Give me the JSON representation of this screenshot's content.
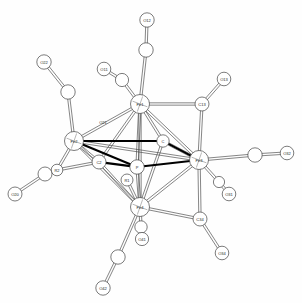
{
  "figure": {
    "type": "molecular-structure-diagram",
    "style": "ORTEP thermal-ellipsoid crystal structure",
    "background_color": "#fefefe",
    "line_color": "#3a3a3a",
    "bold_bond_color": "#000000",
    "atom_fill": "#ffffff",
    "atom_stroke": "#444444",
    "label_color": "#2b2b2b",
    "width": 302,
    "height": 303
  },
  "atoms": [
    {
      "id": "Fe1",
      "label": "Fe1",
      "x": 140,
      "y": 104,
      "r": 9.5,
      "kind": "metal",
      "labelled": true
    },
    {
      "id": "Fe2",
      "label": "Fe2",
      "x": 74,
      "y": 141,
      "r": 9.5,
      "kind": "metal",
      "labelled": true
    },
    {
      "id": "Fe3",
      "label": "Fe3",
      "x": 199,
      "y": 160,
      "r": 9.5,
      "kind": "metal",
      "labelled": true
    },
    {
      "id": "Fe4",
      "label": "Fe4",
      "x": 140,
      "y": 207,
      "r": 9.5,
      "kind": "metal",
      "labelled": true
    },
    {
      "id": "C2",
      "label": "C2",
      "x": 99,
      "y": 162,
      "r": 7.0,
      "kind": "carbide",
      "labelled": true
    },
    {
      "id": "Ccen",
      "label": "C",
      "x": 163,
      "y": 141,
      "r": 6.2,
      "kind": "carbide",
      "labelled": true
    },
    {
      "id": "P1core",
      "label": "P",
      "x": 137,
      "y": 167,
      "r": 7.2,
      "kind": "carbide",
      "labelled": true
    },
    {
      "id": "R1",
      "label": "R1",
      "x": 127,
      "y": 180,
      "r": 6.0,
      "kind": "carbide",
      "labelled": true
    },
    {
      "id": "R2",
      "label": "R2",
      "x": 57,
      "y": 170,
      "r": 5.8,
      "kind": "carbide",
      "labelled": true
    },
    {
      "id": "C13",
      "label": "C13",
      "x": 202,
      "y": 104,
      "r": 7.0,
      "kind": "carbonylC",
      "labelled": true
    },
    {
      "id": "C34",
      "label": "C34",
      "x": 200,
      "y": 219,
      "r": 7.0,
      "kind": "carbonylC",
      "labelled": true
    },
    {
      "id": "C12",
      "label": "",
      "x": 146,
      "y": 50,
      "r": 7.2,
      "kind": "carbonylC",
      "labelled": false
    },
    {
      "id": "C11",
      "label": "",
      "x": 122,
      "y": 80,
      "r": 6.6,
      "kind": "carbonylC",
      "labelled": false
    },
    {
      "id": "C22",
      "label": "",
      "x": 68,
      "y": 92,
      "r": 7.2,
      "kind": "carbonylC",
      "labelled": false
    },
    {
      "id": "C20",
      "label": "",
      "x": 45,
      "y": 174,
      "r": 7.0,
      "kind": "carbonylC",
      "labelled": false
    },
    {
      "id": "C32",
      "label": "",
      "x": 255,
      "y": 155,
      "r": 7.2,
      "kind": "carbonylC",
      "labelled": false
    },
    {
      "id": "C31",
      "label": "",
      "x": 219,
      "y": 182,
      "r": 5.6,
      "kind": "carbonylC",
      "labelled": false
    },
    {
      "id": "C41",
      "label": "",
      "x": 141,
      "y": 227,
      "r": 6.2,
      "kind": "carbonylC",
      "labelled": false
    },
    {
      "id": "C42",
      "label": "",
      "x": 118,
      "y": 257,
      "r": 7.2,
      "kind": "carbonylC",
      "labelled": false
    },
    {
      "id": "O12",
      "label": "O12",
      "x": 147,
      "y": 20,
      "r": 7.2,
      "kind": "oxygen",
      "labelled": true
    },
    {
      "id": "O11",
      "label": "O11",
      "x": 104,
      "y": 69,
      "r": 6.8,
      "kind": "oxygen",
      "labelled": true
    },
    {
      "id": "O22",
      "label": "O22",
      "x": 44,
      "y": 62,
      "r": 7.2,
      "kind": "oxygen",
      "labelled": true
    },
    {
      "id": "O20",
      "label": "O20",
      "x": 15,
      "y": 194,
      "r": 7.0,
      "kind": "oxygen",
      "labelled": true
    },
    {
      "id": "O21",
      "label": "O21",
      "x": 103,
      "y": 122,
      "r": 0,
      "kind": "label-only",
      "labelled": true
    },
    {
      "id": "O13",
      "label": "O13",
      "x": 224,
      "y": 79,
      "r": 6.8,
      "kind": "oxygen",
      "labelled": true
    },
    {
      "id": "O32",
      "label": "O32",
      "x": 287,
      "y": 153,
      "r": 6.8,
      "kind": "oxygen",
      "labelled": true
    },
    {
      "id": "O31",
      "label": "O31",
      "x": 229,
      "y": 194,
      "r": 6.8,
      "kind": "oxygen",
      "labelled": true
    },
    {
      "id": "O41",
      "label": "O41",
      "x": 142,
      "y": 239,
      "r": 6.6,
      "kind": "oxygen",
      "labelled": true
    },
    {
      "id": "O42",
      "label": "O42",
      "x": 103,
      "y": 288,
      "r": 7.2,
      "kind": "oxygen",
      "labelled": true
    },
    {
      "id": "O34",
      "label": "O34",
      "x": 222,
      "y": 253,
      "r": 6.8,
      "kind": "oxygen",
      "labelled": true
    }
  ],
  "bonds": [
    {
      "from": "Fe1",
      "to": "Fe2",
      "style": "thin-double"
    },
    {
      "from": "Fe1",
      "to": "Fe3",
      "style": "thin-double"
    },
    {
      "from": "Fe1",
      "to": "Fe4",
      "style": "thin-double"
    },
    {
      "from": "Fe2",
      "to": "Fe4",
      "style": "thin-double"
    },
    {
      "from": "Fe3",
      "to": "Fe4",
      "style": "thin-double"
    },
    {
      "from": "Fe2",
      "to": "Fe3",
      "style": "thin-double"
    },
    {
      "from": "Fe1",
      "to": "C2",
      "style": "thin-double"
    },
    {
      "from": "Fe1",
      "to": "Ccen",
      "style": "thin-double"
    },
    {
      "from": "Fe1",
      "to": "P1core",
      "style": "thin-double"
    },
    {
      "from": "Fe4",
      "to": "C2",
      "style": "thin-double"
    },
    {
      "from": "Fe4",
      "to": "Ccen",
      "style": "thin-double"
    },
    {
      "from": "Fe4",
      "to": "P1core",
      "style": "thin-double"
    },
    {
      "from": "Fe4",
      "to": "R1",
      "style": "thin-double"
    },
    {
      "from": "Fe2",
      "to": "C2",
      "style": "thin-double"
    },
    {
      "from": "Fe3",
      "to": "Ccen",
      "style": "thin-double"
    },
    {
      "from": "Fe2",
      "to": "Ccen",
      "style": "bold"
    },
    {
      "from": "C2",
      "to": "P1core",
      "style": "bold"
    },
    {
      "from": "P1core",
      "to": "Fe3",
      "style": "bold"
    },
    {
      "from": "Ccen",
      "to": "Fe3",
      "style": "bold"
    },
    {
      "from": "Fe2",
      "to": "P1core",
      "style": "bold"
    },
    {
      "from": "Fe1",
      "to": "C12",
      "style": "thin-double"
    },
    {
      "from": "C12",
      "to": "O12",
      "style": "thin-double"
    },
    {
      "from": "Fe1",
      "to": "C11",
      "style": "thin-double"
    },
    {
      "from": "C11",
      "to": "O11",
      "style": "thin-double"
    },
    {
      "from": "Fe1",
      "to": "C13",
      "style": "thin-double"
    },
    {
      "from": "C13",
      "to": "O13",
      "style": "thin-double"
    },
    {
      "from": "C13",
      "to": "Fe3",
      "style": "thin-double"
    },
    {
      "from": "Fe2",
      "to": "C22",
      "style": "thin-double"
    },
    {
      "from": "C22",
      "to": "O22",
      "style": "thin-double"
    },
    {
      "from": "Fe2",
      "to": "R2",
      "style": "thin-double"
    },
    {
      "from": "R2",
      "to": "C20",
      "style": "thin-double"
    },
    {
      "from": "C20",
      "to": "O20",
      "style": "thin-double"
    },
    {
      "from": "C2",
      "to": "R2",
      "style": "thin-double"
    },
    {
      "from": "Fe3",
      "to": "C32",
      "style": "thin-double"
    },
    {
      "from": "C32",
      "to": "O32",
      "style": "thin-double"
    },
    {
      "from": "Fe3",
      "to": "C31",
      "style": "thin-double"
    },
    {
      "from": "C31",
      "to": "O31",
      "style": "thin-double"
    },
    {
      "from": "Fe3",
      "to": "C34",
      "style": "thin-double"
    },
    {
      "from": "C34",
      "to": "O34",
      "style": "thin-double"
    },
    {
      "from": "C34",
      "to": "Fe4",
      "style": "thin-double"
    },
    {
      "from": "Fe4",
      "to": "C41",
      "style": "thin-double"
    },
    {
      "from": "C41",
      "to": "O41",
      "style": "thin-double"
    },
    {
      "from": "Fe4",
      "to": "C42",
      "style": "thin-double"
    },
    {
      "from": "C42",
      "to": "O42",
      "style": "thin-double"
    }
  ],
  "labels_visible": [
    "O12",
    "O11",
    "O22",
    "O21",
    "O20",
    "O13",
    "O32",
    "O31",
    "O41",
    "O42",
    "O34",
    "Fe1",
    "Fe2",
    "Fe3",
    "Fe4",
    "C13",
    "C34",
    "C2",
    "R1",
    "R2"
  ]
}
